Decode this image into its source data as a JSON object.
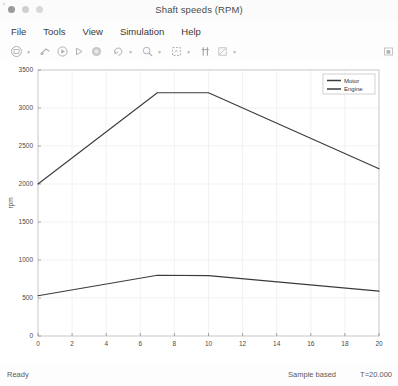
{
  "window": {
    "title": "Shaft speeds (RPM)",
    "corner_mark": "r",
    "controls": [
      {
        "name": "close",
        "color": "#9a9a9a"
      },
      {
        "name": "minimize",
        "color": "#cfcfcf"
      },
      {
        "name": "maximize",
        "color": "#d8d8d8"
      }
    ]
  },
  "menubar": {
    "items": [
      {
        "label": "File"
      },
      {
        "label": "Tools"
      },
      {
        "label": "View"
      },
      {
        "label": "Simulation"
      },
      {
        "label": "Help"
      }
    ]
  },
  "toolbar": {
    "icons": [
      {
        "name": "print-icon",
        "caret": true
      },
      {
        "name": "configuration-icon",
        "caret": false
      },
      {
        "name": "run-icon",
        "caret": false
      },
      {
        "name": "step-forward-icon",
        "caret": false
      },
      {
        "name": "stop-icon",
        "caret": false
      },
      {
        "name": "restore-view-icon",
        "caret": true
      },
      {
        "name": "zoom-icon",
        "caret": true
      },
      {
        "name": "autoscale-icon",
        "caret": true
      },
      {
        "name": "cursor-measure-icon",
        "caret": false
      },
      {
        "name": "style-icon",
        "caret": true
      }
    ],
    "right_icon": "docking-icon"
  },
  "statusbar": {
    "ready": "Ready",
    "mode": "Sample based",
    "time": "T=20.000"
  },
  "chart_data": {
    "type": "line",
    "title": "Shaft speeds (RPM)",
    "xlabel": "",
    "ylabel": "rpm",
    "xlim": [
      0,
      20
    ],
    "ylim": [
      0,
      3500
    ],
    "xticks": [
      0,
      2,
      4,
      6,
      8,
      10,
      12,
      14,
      16,
      18,
      20
    ],
    "yticks": [
      0,
      500,
      1000,
      1500,
      2000,
      2500,
      3000,
      3500
    ],
    "grid": true,
    "legend_position": "top-right",
    "series": [
      {
        "name": "Motor",
        "color": "#3b3b3b",
        "x": [
          0,
          7,
          10,
          20
        ],
        "values": [
          2000,
          3200,
          3200,
          2200
        ]
      },
      {
        "name": "Engine",
        "color": "#3b3b3b",
        "x": [
          0,
          7,
          10,
          20
        ],
        "values": [
          530,
          800,
          795,
          590
        ]
      }
    ]
  }
}
